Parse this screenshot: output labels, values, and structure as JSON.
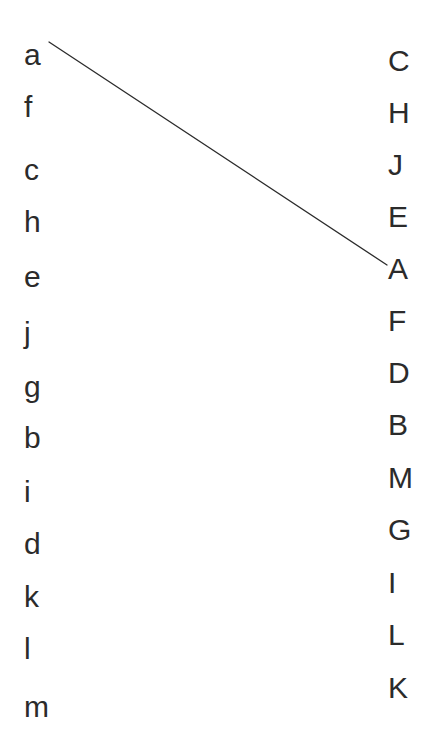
{
  "diagram": {
    "background_color": "#ffffff",
    "text_color": "#2b2b2b",
    "line_color": "#2b2b2b",
    "width": 438,
    "height": 744,
    "left_column": {
      "name": "lowercase-letters",
      "x": 26,
      "start_y": 40,
      "spacing": 52,
      "items": [
        {
          "label": "a",
          "y": 40
        },
        {
          "label": "f",
          "y": 92
        },
        {
          "label": "c",
          "y": 155
        },
        {
          "label": "h",
          "y": 207
        },
        {
          "label": "e",
          "y": 262
        },
        {
          "label": "j",
          "y": 318
        },
        {
          "label": "g",
          "y": 372
        },
        {
          "label": "b",
          "y": 423
        },
        {
          "label": "i",
          "y": 477
        },
        {
          "label": "d",
          "y": 529
        },
        {
          "label": "k",
          "y": 582
        },
        {
          "label": "l",
          "y": 634
        },
        {
          "label": "m",
          "y": 692
        }
      ]
    },
    "right_column": {
      "name": "uppercase-letters",
      "x": 390,
      "start_y": 46,
      "spacing": 52,
      "items": [
        {
          "label": "C",
          "y": 46
        },
        {
          "label": "H",
          "y": 98
        },
        {
          "label": "J",
          "y": 150
        },
        {
          "label": "E",
          "y": 202
        },
        {
          "label": "A",
          "y": 254
        },
        {
          "label": "F",
          "y": 306
        },
        {
          "label": "D",
          "y": 358
        },
        {
          "label": "B",
          "y": 410
        },
        {
          "label": "M",
          "y": 463
        },
        {
          "label": "G",
          "y": 515
        },
        {
          "label": "I",
          "y": 568
        },
        {
          "label": "L",
          "y": 620
        },
        {
          "label": "K",
          "y": 673
        }
      ]
    },
    "connections": [
      {
        "from": "a",
        "to": "A",
        "x1": 49,
        "y1": 42,
        "x2": 387,
        "y2": 265
      }
    ]
  }
}
